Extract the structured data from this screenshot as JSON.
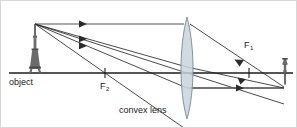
{
  "figure": {
    "type": "optics-ray-diagram",
    "width": 297,
    "height": 128,
    "background_color": "#ffffff",
    "border_color": "#d8d8d8"
  },
  "labels": {
    "object": "object",
    "lens": "convex lens",
    "focal_near": "F",
    "focal_near_sub": "2",
    "focal_far": "F",
    "focal_far_sub": "1"
  },
  "colors": {
    "axis": "#1d1d1d",
    "ray": "#2b2b2b",
    "ray_highlight": "#8d8d8d",
    "lens_fill": "#c9d2dc",
    "lens_stroke": "#7d8694",
    "text": "#1a1a1a",
    "tower": "#6b6b6b"
  },
  "geometry": {
    "principal_axis_y": 72,
    "axis_x_start": 8,
    "axis_x_end": 292,
    "lens_center_x": 186,
    "lens_top_y": 16,
    "lens_bottom_y": 118,
    "lens_half_width": 7,
    "object_base_x": 34,
    "object_tip_y": 23,
    "image_base_x": 284,
    "image_tip_y": 59,
    "focal_left_x": 104,
    "focal_right_x": 248
  },
  "elements": {
    "object_name": "upright object at left of lens",
    "image_name": "inverted real image at right of lens",
    "rays": [
      {
        "id": "ray-parallel",
        "description": "parallel ray from object tip to lens, refracted through far focal point F1 to image tip",
        "style": "gray-incident"
      },
      {
        "id": "ray-center",
        "description": "ray through the optical centre of the lens, undeviated to image tip",
        "style": "thin"
      },
      {
        "id": "ray-focal",
        "description": "ray through near focal point F2, refracted parallel to axis then to image tip",
        "style": "thin"
      }
    ],
    "arrow_markers": 5,
    "tick_marks": 2
  }
}
